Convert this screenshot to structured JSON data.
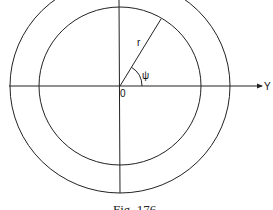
{
  "figure": {
    "caption": "Fig. 176",
    "labels": {
      "radius": "r",
      "angle": "ψ",
      "origin": "0",
      "axis": "Y"
    },
    "colors": {
      "stroke": "#222222",
      "background": "#ffffff"
    }
  }
}
